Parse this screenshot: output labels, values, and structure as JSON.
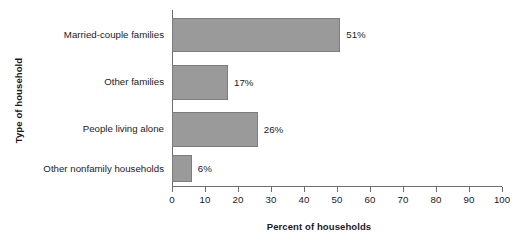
{
  "chart_data": {
    "type": "bar",
    "orientation": "horizontal",
    "title": "",
    "xlabel": "Percent of households",
    "ylabel": "Type of household",
    "categories": [
      "Married-couple families",
      "Other families",
      "People living alone",
      "Other nonfamily households"
    ],
    "values": [
      51,
      17,
      26,
      6
    ],
    "value_labels": [
      "51%",
      "17%",
      "26%",
      "6%"
    ],
    "xlim": [
      0,
      100
    ],
    "xticks": [
      0,
      10,
      20,
      30,
      40,
      50,
      60,
      70,
      80,
      90,
      100
    ],
    "xtick_labels": [
      "0",
      "10",
      "20",
      "30",
      "40",
      "50",
      "60",
      "70",
      "80",
      "90",
      "100"
    ],
    "grid": false,
    "legend": false,
    "bar_color": "#9a9a9a",
    "bar_edge_color": "#7d7d7d",
    "axis_color": "#6e6e6e",
    "background": "#ffffff"
  }
}
